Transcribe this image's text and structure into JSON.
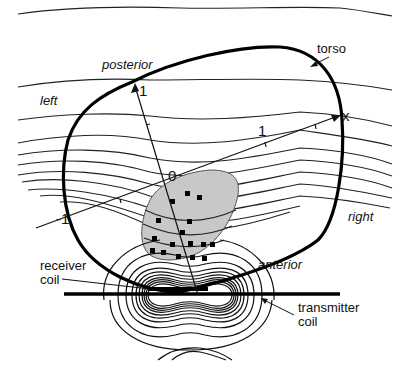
{
  "figure": {
    "type": "diagram",
    "labels": {
      "torso": "torso",
      "posterior": "posterior",
      "anterior": "anterior",
      "left": "left",
      "right": "right",
      "receiver_coil_line1": "receiver",
      "receiver_coil_line2": "coil",
      "transmitter_coil_line1": "transmitter",
      "transmitter_coil_line2": "coil"
    },
    "axes": {
      "x_axis_label": "x",
      "x_tick_positive": "1",
      "x_tick_negative": "-1",
      "y_axis_tick": "1",
      "origin_label": "0"
    },
    "colors": {
      "ink": "#111111",
      "shaded_region": "#c8c8c8",
      "background": "#ffffff"
    },
    "sample_points_count": 16
  }
}
